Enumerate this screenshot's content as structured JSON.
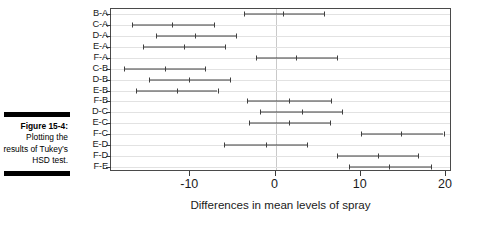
{
  "figure": {
    "caption_title": "Figure 15-4:",
    "caption_body": "Plotting the results of Tukey’s HSD test."
  },
  "chart_data": {
    "type": "scatter",
    "subtype": "confidence-interval-dot-plot",
    "title": "",
    "xlabel": "Differences in mean levels of spray",
    "ylabel": "",
    "xlim": [
      -19.3,
      20.7
    ],
    "ylim_categories_order": "top-to-bottom",
    "grid": true,
    "grid_axis": "y",
    "reference_line_x": 0,
    "xticks": [
      -10,
      0,
      10,
      20
    ],
    "xtick_labels": [
      "-10",
      "0",
      "10",
      "20"
    ],
    "categories": [
      "B-A",
      "C-A",
      "D-A",
      "E-A",
      "F-A",
      "C-B",
      "D-B",
      "E-B",
      "F-B",
      "D-C",
      "E-C",
      "F-C",
      "E-D",
      "F-D",
      "F-E"
    ],
    "points": [
      {
        "label": "B-A",
        "lower": -3.7,
        "center": 0.9,
        "upper": 5.7
      },
      {
        "label": "C-A",
        "lower": -16.9,
        "center": -12.2,
        "upper": -7.2
      },
      {
        "label": "D-A",
        "lower": -14.0,
        "center": -9.4,
        "upper": -4.6
      },
      {
        "label": "E-A",
        "lower": -15.6,
        "center": -10.7,
        "upper": -5.9
      },
      {
        "label": "F-A",
        "lower": -2.3,
        "center": 2.4,
        "upper": 7.2
      },
      {
        "label": "C-B",
        "lower": -17.8,
        "center": -13.0,
        "upper": -8.3
      },
      {
        "label": "D-B",
        "lower": -14.8,
        "center": -10.1,
        "upper": -5.3
      },
      {
        "label": "E-B",
        "lower": -16.4,
        "center": -11.6,
        "upper": -6.8
      },
      {
        "label": "F-B",
        "lower": -3.3,
        "center": 1.6,
        "upper": 6.5
      },
      {
        "label": "D-C",
        "lower": -1.8,
        "center": 3.1,
        "upper": 7.8
      },
      {
        "label": "E-C",
        "lower": -3.1,
        "center": 1.6,
        "upper": 6.4
      },
      {
        "label": "F-C",
        "lower": 10.0,
        "center": 14.7,
        "upper": 19.7
      },
      {
        "label": "E-D",
        "lower": -6.0,
        "center": -1.1,
        "upper": 3.7
      },
      {
        "label": "F-D",
        "lower": 7.2,
        "center": 12.0,
        "upper": 16.7
      },
      {
        "label": "F-E",
        "lower": 8.6,
        "center": 13.3,
        "upper": 18.2
      }
    ],
    "colors": {
      "interval": "#3f3f3f",
      "grid": "#e2e2e2",
      "axis": "#4a4a4a",
      "zero_line": "#c9c9c9",
      "text": "#1a1a1a"
    }
  }
}
